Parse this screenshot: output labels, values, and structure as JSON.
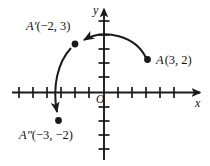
{
  "figure": {
    "background_color": "#ffffff",
    "stroke_color": "#1a1a1a",
    "axes": {
      "x_axis_label": "x",
      "y_axis_label": "y",
      "origin_label": "O",
      "x_range": [
        -6,
        6
      ],
      "y_range": [
        -5,
        5
      ],
      "tick_spacing_units": 1,
      "grid": false,
      "arrowheads": [
        "x-positive",
        "y-positive"
      ]
    },
    "points": [
      {
        "id": "A",
        "label": "A (3, 2)",
        "label_name": "A",
        "coords": [
          3,
          2
        ],
        "coords_text": "(3, 2)",
        "marker": "filled-dot",
        "label_position": "right"
      },
      {
        "id": "A-prime",
        "label": "A′(−2, 3)",
        "label_name": "A′",
        "coords": [
          -2,
          3
        ],
        "coords_text": "(−2, 3)",
        "marker": "filled-dot",
        "label_position": "upper-left"
      },
      {
        "id": "A-double-prime",
        "label": "A″(−3, −2)",
        "label_name": "A″",
        "coords": [
          -3,
          -2
        ],
        "coords_text": "(−3, −2)",
        "marker": "filled-dot",
        "label_position": "below-left"
      }
    ],
    "arrows": [
      {
        "id": "arrow-a-to-a-prime",
        "from": "A",
        "to": "A-prime",
        "style": "curved",
        "direction": "leftward-arc-over-top"
      },
      {
        "id": "arrow-a-prime-to-a-double-prime",
        "from": "A-prime",
        "to": "A-double-prime",
        "style": "curved",
        "direction": "downward-arc-left"
      }
    ]
  }
}
